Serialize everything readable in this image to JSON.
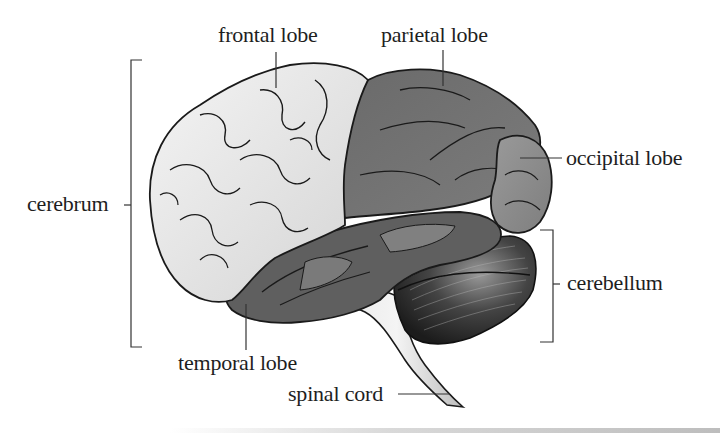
{
  "diagram": {
    "labels": {
      "frontal_lobe": "frontal lobe",
      "parietal_lobe": "parietal lobe",
      "occipital_lobe": "occipital lobe",
      "cerebrum": "cerebrum",
      "cerebellum": "cerebellum",
      "temporal_lobe": "temporal lobe",
      "spinal_cord": "spinal cord"
    },
    "colors": {
      "frontal_lobe": "#e6e6e6",
      "parietal_lobe": "#6e6e6e",
      "occipital_lobe": "#8a8a8a",
      "temporal_lobe": "#5f5f5f",
      "cerebellum": "#3a3a3a",
      "spinal_cord": "#d8d8d8",
      "outline": "#1a1a1a",
      "leader_lines": "#333333"
    }
  }
}
